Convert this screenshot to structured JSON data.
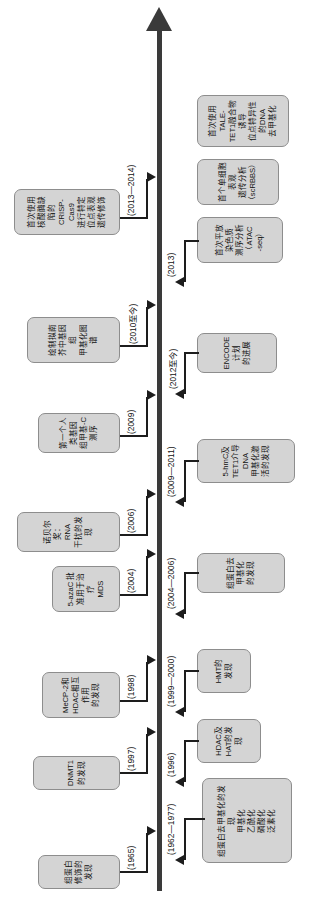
{
  "figure": {
    "type": "timeline",
    "orientation": "rotated-90-ccw",
    "axis": {
      "direction": "left-to-right, arrow at right end",
      "color": "#3a3a3a"
    },
    "colors": {
      "box_fill": "#d4d4d4",
      "box_border": "#8d8d8d",
      "axis": "#3a3a3a",
      "connector": "#1d1d1d",
      "text": "#111111",
      "background": "#ffffff"
    }
  },
  "events_above": [
    {
      "year": "(1965)",
      "label": "组蛋白修饰的发现"
    },
    {
      "year": "(1997)",
      "label": "DNMT1的发现"
    },
    {
      "year": "(1998)",
      "label": "MeCP-2和\nHDAC相互作用\n的发现"
    },
    {
      "year": "(2004)",
      "label": "5-azaC 批\n准用于治疗\nMDS"
    },
    {
      "year": "(2006)",
      "label": "诺贝尔奖：RNA\n干扰的发现"
    },
    {
      "year": "(2009)",
      "label": "第一个人类基因\n组甲基-C测序"
    },
    {
      "year": "(2010至今)",
      "label": "绘制拟南芥中基因组\n甲基化图谱"
    },
    {
      "year": "(2013—2014)",
      "label": "首次使用核酸酶缺陷的CRISP-Cas9\n进行特定位点表观遗传修饰"
    }
  ],
  "events_below": [
    {
      "year": "(1962—1977)",
      "label": "组蛋白去甲基化的发现\n甲基化\n乙酰化\n磷酸化\n泛素化"
    },
    {
      "year": "(1996)",
      "label": "HDAC及\nHAT的发\n现"
    },
    {
      "year": "(1999—2000)",
      "label": "HMT的\n发现"
    },
    {
      "year": "(2004—2006)",
      "label": "组蛋白去甲基化\n的发现"
    },
    {
      "year": "(2009—2011)",
      "label": "5-hmC及TET1介导DNA\n甲基化激活的发现"
    },
    {
      "year": "(2012至今)",
      "label": "ENCODE计划\n的进展"
    },
    {
      "year": "(2013)",
      "label": "首次平放染色质\n测序分析（ATAC\n-seq）"
    }
  ],
  "events_below_extra": [
    {
      "label": "首个单细胞表观\n遗传分析\n（scRBBS）"
    },
    {
      "label": "首次使用TALE-\nTET1融合物诱导\n位点特异性的DNA\n去甲基化"
    }
  ]
}
